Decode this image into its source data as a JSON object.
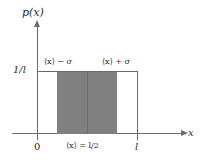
{
  "axes": {
    "y_axis_label": "p(x)",
    "x_axis_label": "x",
    "y_tick_label": "1/l",
    "x_tick_origin_label": "0",
    "x_tick_end_label": "l"
  },
  "annotations": {
    "left_band_edge": "⟨x⟩ − σ",
    "right_band_edge": "⟨x⟩ + σ",
    "mean_label": "⟨x⟩ = l/2"
  },
  "colors": {
    "shading": "#808080",
    "line": "#6b6b6b",
    "text": "#2b2b2b",
    "background": "#ffffff"
  },
  "chart_data": {
    "type": "area",
    "title": "",
    "xlabel": "x",
    "ylabel": "p(x)",
    "xlim": [
      0,
      1
    ],
    "ylim": [
      0,
      1.25
    ],
    "x_tick_values": [
      0,
      1
    ],
    "x_tick_labels": [
      "0",
      "l"
    ],
    "y_tick_values": [
      1
    ],
    "y_tick_labels": [
      "1/l"
    ],
    "grid": false,
    "legend": false,
    "series": [
      {
        "name": "p(x) = 1/l",
        "x": [
          0,
          0,
          1,
          1
        ],
        "values": [
          0,
          1,
          1,
          0
        ],
        "note": "Uniform density: p(x) = 1/l for 0 <= x <= l, zero elsewhere"
      }
    ],
    "shaded_region": {
      "label": "one standard deviation band",
      "x_start": 0.2113,
      "x_end": 0.7887,
      "height": 1,
      "start_label": "⟨x⟩ − σ",
      "end_label": "⟨x⟩ + σ",
      "color": "#808080"
    },
    "markers": [
      {
        "name": "mean",
        "x": 0.5,
        "label": "⟨x⟩ = l/2"
      }
    ]
  }
}
